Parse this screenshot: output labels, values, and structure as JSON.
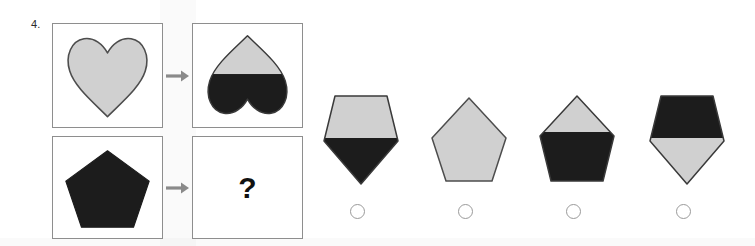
{
  "question": {
    "number_label": "4.",
    "unknown_marker": "?",
    "type": "visual-analogy"
  },
  "colors": {
    "shape_light": "#d0d0d0",
    "shape_dark": "#1c1c1c",
    "shape_outline": "#4d4d4d",
    "panel_border": "#8e8e8e",
    "arrow": "#8a8a8a",
    "radio_outline": "#9a9a9a",
    "background": "#ffffff"
  },
  "stimulus": {
    "rows": [
      {
        "name": "heart-row",
        "source": {
          "shape": "heart",
          "orientation": "point-down",
          "fill": "light-gray",
          "description": "light gray heart, point down"
        },
        "arrow_label": "transforms-to",
        "result": {
          "shape": "heart",
          "orientation": "point-up",
          "fill": "top-light-bottom-dark",
          "description": "heart rotated 180 degrees, top half light gray, bottom half black"
        }
      },
      {
        "name": "pentagon-row",
        "source": {
          "shape": "pentagon",
          "orientation": "point-up",
          "fill": "dark",
          "description": "solid black pentagon, point up"
        },
        "arrow_label": "transforms-to",
        "result": {
          "shape": "unknown",
          "orientation": "unknown",
          "fill": "unknown",
          "description": "question mark placeholder"
        }
      }
    ]
  },
  "options": [
    {
      "id": "A",
      "shape": "pentagon",
      "orientation": "point-down",
      "fill": "top-light-bottom-dark",
      "description": "inverted pentagon, upper portion light gray, lower point black",
      "selected": false
    },
    {
      "id": "B",
      "shape": "pentagon",
      "orientation": "point-up",
      "fill": "light",
      "description": "upright pentagon, entirely light gray",
      "selected": false
    },
    {
      "id": "C",
      "shape": "pentagon",
      "orientation": "point-up",
      "fill": "top-light-bottom-dark",
      "description": "upright pentagon, top half light gray, bottom half black",
      "selected": false
    },
    {
      "id": "D",
      "shape": "pentagon",
      "orientation": "point-down",
      "fill": "top-dark-bottom-light",
      "description": "inverted pentagon, upper portion black, lower point light gray",
      "selected": false
    }
  ]
}
